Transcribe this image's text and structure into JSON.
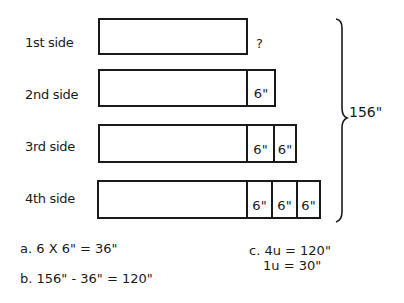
{
  "rows": [
    {
      "label": "1st side",
      "units": 0,
      "annotation": "?"
    },
    {
      "label": "2nd side",
      "units": 1,
      "segment": "6\""
    },
    {
      "label": "3rd side",
      "units": 2,
      "segment": "6\""
    },
    {
      "label": "4th side",
      "units": 3,
      "segment": "6\""
    }
  ],
  "segments": {
    "r2s1": "6\"",
    "r3s1": "6\"",
    "r3s2": "6\"",
    "r4s1": "6\"",
    "r4s2": "6\"",
    "r4s3": "6\""
  },
  "total_label": "156\"",
  "steps": {
    "a": "a. 6 X 6\" = 36\"",
    "b": "b. 156\" - 36\" = 120\"",
    "c1": "c. 4u = 120\"",
    "c2": "1u = 30\""
  }
}
